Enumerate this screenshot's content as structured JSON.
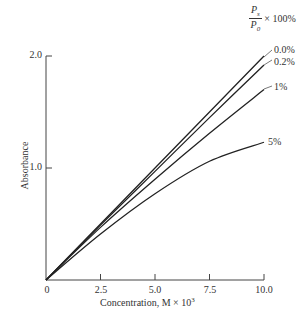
{
  "chart_data": {
    "type": "line",
    "title": "",
    "xlabel": "Concentration, M × 10³",
    "ylabel": "Absorbance",
    "xlim": [
      0,
      10.0
    ],
    "ylim": [
      0,
      2.0
    ],
    "x_ticks": [
      "0",
      "2.5",
      "5.0",
      "7.5",
      "10.0"
    ],
    "y_ticks": [
      "1.0",
      "2.0"
    ],
    "grid": false,
    "legend_title": "Ps/P0 × 100%",
    "x": [
      0,
      2.5,
      5.0,
      7.5,
      10.0
    ],
    "series": [
      {
        "name": "0.0%",
        "values": [
          0,
          0.5,
          1.0,
          1.5,
          2.0
        ]
      },
      {
        "name": "0.2%",
        "values": [
          0,
          0.49,
          0.97,
          1.45,
          1.92
        ]
      },
      {
        "name": "1%",
        "values": [
          0,
          0.47,
          0.9,
          1.31,
          1.7
        ]
      },
      {
        "name": "5%",
        "values": [
          0,
          0.41,
          0.77,
          1.06,
          1.23
        ]
      }
    ]
  },
  "labels": {
    "xlabel": "Concentration, M × 10",
    "xlabel_exp": "3",
    "ylabel": "Absorbance",
    "legend_num": "P",
    "legend_num_sub": "s",
    "legend_den": "P",
    "legend_den_sub": "0",
    "legend_mult": "× 100%",
    "series_labels": [
      "0.0%",
      "0.2%",
      "1%",
      "5%"
    ],
    "x_ticks": [
      "0",
      "2.5",
      "5.0",
      "7.5",
      "10.0"
    ],
    "y_ticks": [
      "1.0",
      "2.0"
    ]
  }
}
